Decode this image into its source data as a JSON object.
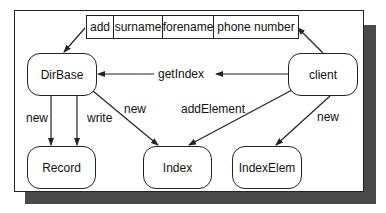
{
  "diagram": {
    "record_table": {
      "fields": [
        "add",
        "surname",
        "forename",
        "phone number"
      ]
    },
    "nodes": {
      "dirbase": "DirBase",
      "client": "client",
      "record": "Record",
      "index": "Index",
      "indexelem": "IndexElem"
    },
    "edges": [
      {
        "from": "DirBase",
        "to": "record_table",
        "label": ""
      },
      {
        "from": "client",
        "to": "record_table",
        "label": ""
      },
      {
        "from": "client",
        "to": "DirBase",
        "label": "getIndex"
      },
      {
        "from": "DirBase",
        "to": "Record",
        "label": "new"
      },
      {
        "from": "DirBase",
        "to": "Record",
        "label": "write"
      },
      {
        "from": "DirBase",
        "to": "Index",
        "label": "new"
      },
      {
        "from": "client",
        "to": "Index",
        "label": "addElement"
      },
      {
        "from": "client",
        "to": "IndexElem",
        "label": "new"
      }
    ],
    "labels": {
      "get_index": "getIndex",
      "new_record": "new",
      "write_record": "write",
      "new_index": "new",
      "add_element": "addElement",
      "new_indexelem": "new"
    },
    "colors": {
      "line": "#222222",
      "shadow": "#4a4a4a",
      "background": "#ffffff"
    }
  }
}
